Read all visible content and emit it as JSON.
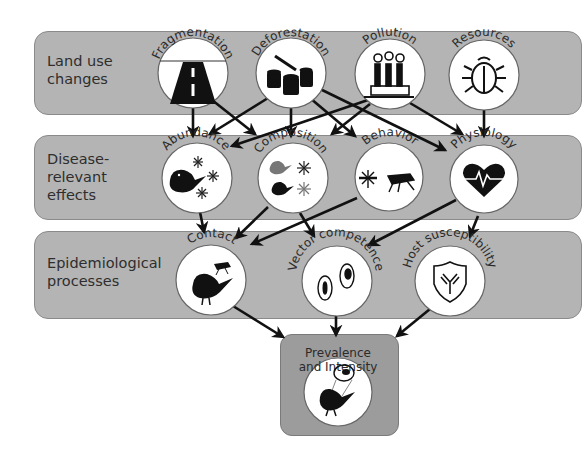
{
  "rows": [
    {
      "label": "Land use\nchanges",
      "nodes": [
        {
          "id": "fragmentation",
          "title": "Fragmentation",
          "icon": "road-icon"
        },
        {
          "id": "deforestation",
          "title": "Deforestation",
          "icon": "tree-stump-icon"
        },
        {
          "id": "pollution",
          "title": "Pollution",
          "icon": "factory-icon"
        },
        {
          "id": "resources",
          "title": "Resources",
          "icon": "beetle-icon"
        }
      ]
    },
    {
      "label": "Disease-\nrelevant\neffects",
      "nodes": [
        {
          "id": "abundance",
          "title": "Abundance",
          "icon": "bird-mosquitoes-icon"
        },
        {
          "id": "composition",
          "title": "Composition",
          "icon": "mixed-species-icon"
        },
        {
          "id": "behavior",
          "title": "Behavior",
          "icon": "mosquito-icon"
        },
        {
          "id": "physiology",
          "title": "Physiology",
          "icon": "heart-pulse-icon"
        }
      ]
    },
    {
      "label": "Epidemiological\nprocesses",
      "nodes": [
        {
          "id": "contact",
          "title": "Contact",
          "icon": "bird-mosquito-icon"
        },
        {
          "id": "vector_competence",
          "title": "Vector competence",
          "icon": "parasite-cells-icon"
        },
        {
          "id": "host_susceptibility",
          "title": "Host susceptibility",
          "icon": "antibody-shield-icon"
        }
      ]
    }
  ],
  "outcome": {
    "title_line1": "Prevalence",
    "title_line2": "and Intensity",
    "icon": "infected-bird-icon"
  },
  "edges": [
    [
      "fragmentation",
      "abundance"
    ],
    [
      "fragmentation",
      "composition"
    ],
    [
      "deforestation",
      "abundance"
    ],
    [
      "deforestation",
      "composition"
    ],
    [
      "deforestation",
      "behavior"
    ],
    [
      "deforestation",
      "physiology"
    ],
    [
      "pollution",
      "abundance"
    ],
    [
      "pollution",
      "composition"
    ],
    [
      "pollution",
      "physiology"
    ],
    [
      "resources",
      "physiology"
    ],
    [
      "abundance",
      "contact"
    ],
    [
      "composition",
      "contact"
    ],
    [
      "composition",
      "vector_competence"
    ],
    [
      "behavior",
      "contact"
    ],
    [
      "physiology",
      "vector_competence"
    ],
    [
      "physiology",
      "host_susceptibility"
    ],
    [
      "contact",
      "outcome"
    ],
    [
      "vector_competence",
      "outcome"
    ],
    [
      "host_susceptibility",
      "outcome"
    ]
  ]
}
